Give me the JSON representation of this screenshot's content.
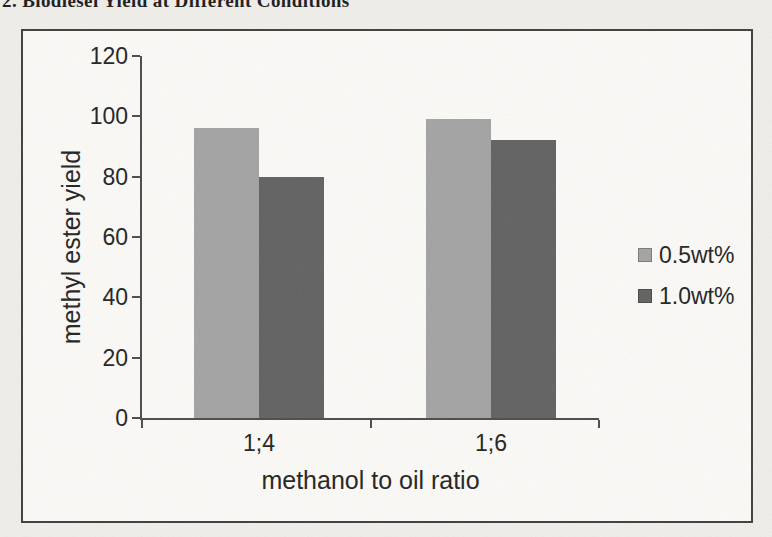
{
  "caption": {
    "text": "2. Biodiesel Yield at Different Conditions"
  },
  "chart_data": {
    "type": "bar",
    "title": "",
    "categories": [
      "1;4",
      "1;6"
    ],
    "series": [
      {
        "name": "0.5wt%",
        "color": "#a3a3a3",
        "values": [
          96,
          99
        ]
      },
      {
        "name": "1.0wt%",
        "color": "#616161",
        "values": [
          80,
          92
        ]
      }
    ],
    "xlabel": "methanol to oil ratio",
    "ylabel": "methyl ester yield",
    "ylim": [
      0,
      120
    ],
    "yticks": [
      0,
      20,
      40,
      60,
      80,
      100,
      120
    ],
    "legend_position": "right",
    "grid": false
  }
}
